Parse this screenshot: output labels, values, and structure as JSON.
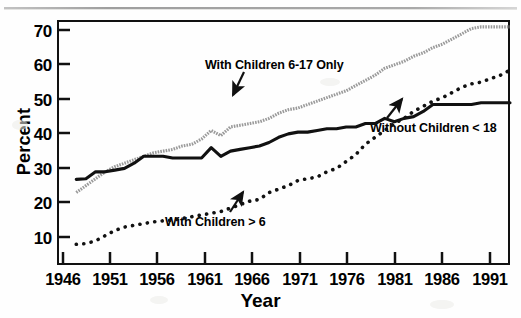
{
  "chart_data": {
    "type": "line",
    "title": "",
    "xlabel": "Year",
    "ylabel": "Percent",
    "xlim": [
      1946,
      1993
    ],
    "ylim": [
      4,
      75
    ],
    "grid": false,
    "legend_position": "inline-annotations",
    "xticks": [
      1946,
      1951,
      1956,
      1961,
      1966,
      1971,
      1976,
      1981,
      1986,
      1991
    ],
    "yticks": [
      10,
      20,
      30,
      40,
      50,
      60,
      70
    ],
    "series": [
      {
        "name": "With Children 6-17 Only",
        "style": "stippled-gray-line",
        "color": "#9a9a9a",
        "x": [
          1948,
          1949,
          1950,
          1951,
          1952,
          1953,
          1954,
          1955,
          1956,
          1957,
          1958,
          1959,
          1960,
          1961,
          1962,
          1963,
          1964,
          1965,
          1966,
          1967,
          1968,
          1969,
          1970,
          1971,
          1972,
          1973,
          1974,
          1975,
          1976,
          1977,
          1978,
          1979,
          1980,
          1981,
          1982,
          1983,
          1984,
          1985,
          1986,
          1987,
          1988,
          1989,
          1990,
          1991,
          1992,
          1993
        ],
        "values": [
          25.0,
          27.0,
          29.0,
          31.0,
          32.5,
          33.5,
          34.5,
          35.5,
          36.5,
          37.0,
          37.5,
          38.5,
          39.0,
          40.5,
          43.0,
          41.5,
          44.0,
          44.5,
          45.0,
          45.5,
          46.5,
          48.0,
          49.0,
          49.5,
          50.5,
          51.5,
          52.5,
          53.5,
          54.5,
          56.0,
          57.5,
          59.0,
          61.0,
          62.0,
          63.0,
          64.5,
          65.5,
          67.0,
          68.0,
          69.5,
          71.0,
          72.5,
          73.0,
          73.0,
          73.0,
          73.0
        ]
      },
      {
        "name": "Without Children < 18",
        "style": "solid-black-line",
        "color": "#111111",
        "x": [
          1948,
          1949,
          1950,
          1951,
          1952,
          1953,
          1954,
          1955,
          1956,
          1957,
          1958,
          1959,
          1960,
          1961,
          1962,
          1963,
          1964,
          1965,
          1966,
          1967,
          1968,
          1969,
          1970,
          1971,
          1972,
          1973,
          1974,
          1975,
          1976,
          1977,
          1978,
          1979,
          1980,
          1981,
          1982,
          1983,
          1984,
          1985,
          1986,
          1987,
          1988,
          1989,
          1990,
          1991,
          1992,
          1993
        ],
        "values": [
          28.8,
          29.0,
          31.0,
          31.0,
          31.5,
          32.0,
          33.5,
          35.5,
          35.5,
          35.5,
          35.0,
          35.0,
          35.0,
          35.0,
          38.0,
          35.5,
          37.0,
          37.5,
          38.0,
          38.5,
          39.5,
          41.0,
          42.0,
          42.5,
          42.5,
          43.0,
          43.5,
          43.5,
          44.0,
          44.0,
          45.0,
          45.0,
          46.5,
          45.5,
          46.5,
          47.0,
          48.5,
          50.5,
          50.5,
          50.5,
          50.5,
          50.5,
          51.0,
          51.0,
          51.0,
          51.0
        ]
      },
      {
        "name": "With Children > 6",
        "style": "dotted-black-line",
        "color": "#111111",
        "x": [
          1948,
          1949,
          1950,
          1951,
          1952,
          1953,
          1954,
          1955,
          1956,
          1957,
          1958,
          1959,
          1960,
          1961,
          1962,
          1963,
          1964,
          1965,
          1966,
          1967,
          1968,
          1969,
          1970,
          1971,
          1972,
          1973,
          1974,
          1975,
          1976,
          1977,
          1978,
          1979,
          1980,
          1981,
          1982,
          1983,
          1984,
          1985,
          1986,
          1987,
          1988,
          1989,
          1990,
          1991,
          1992,
          1993
        ],
        "values": [
          10.0,
          10.2,
          11.0,
          12.5,
          14.0,
          15.0,
          15.5,
          16.0,
          16.5,
          16.8,
          17.0,
          17.5,
          18.0,
          18.5,
          19.0,
          19.5,
          20.5,
          21.5,
          22.5,
          23.0,
          25.0,
          26.0,
          27.0,
          28.5,
          29.0,
          29.5,
          31.0,
          32.0,
          34.0,
          36.0,
          39.0,
          41.0,
          43.0,
          45.0,
          46.5,
          48.5,
          50.0,
          51.5,
          52.5,
          54.0,
          55.5,
          56.5,
          57.0,
          58.0,
          59.0,
          60.5
        ]
      }
    ],
    "annotations": [
      {
        "text": "With Children 6-17 Only",
        "points_to_series": "With Children 6-17 Only"
      },
      {
        "text": "Without Children < 18",
        "points_to_series": "Without Children < 18"
      },
      {
        "text": "With Children > 6",
        "points_to_series": "With Children > 6"
      }
    ]
  },
  "axes": {
    "y_title": "Percent",
    "x_title": "Year",
    "y_tick_labels": [
      "70",
      "60",
      "50",
      "40",
      "30",
      "20",
      "10"
    ],
    "x_tick_labels": [
      "1946",
      "1951",
      "1956",
      "1961",
      "1966",
      "1971",
      "1976",
      "1981",
      "1986",
      "1991"
    ]
  }
}
